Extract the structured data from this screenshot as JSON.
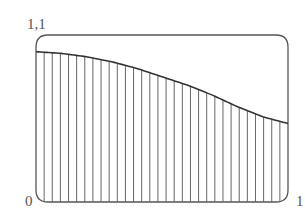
{
  "labels": {
    "top_left": "1,1",
    "bottom_left": "0",
    "bottom_right": "1"
  },
  "colors": {
    "stroke": "#555555",
    "curve": "#333333",
    "background": "#ffffff"
  },
  "chart_data": {
    "type": "area",
    "xlim": [
      0,
      1
    ],
    "ylim": [
      0,
      1
    ],
    "corner_labels": {
      "origin": "0",
      "x_end": "1",
      "top_left": "1,1"
    },
    "num_vertical_lines": 31,
    "x": [
      0.0,
      0.1,
      0.2,
      0.3,
      0.4,
      0.5,
      0.6,
      0.7,
      0.8,
      0.9,
      1.0
    ],
    "y": [
      0.9,
      0.89,
      0.87,
      0.84,
      0.8,
      0.75,
      0.7,
      0.64,
      0.57,
      0.51,
      0.47
    ]
  },
  "frame": {
    "left": 36,
    "top": 35,
    "right": 288,
    "bottom": 202,
    "corner_radius": 12
  }
}
